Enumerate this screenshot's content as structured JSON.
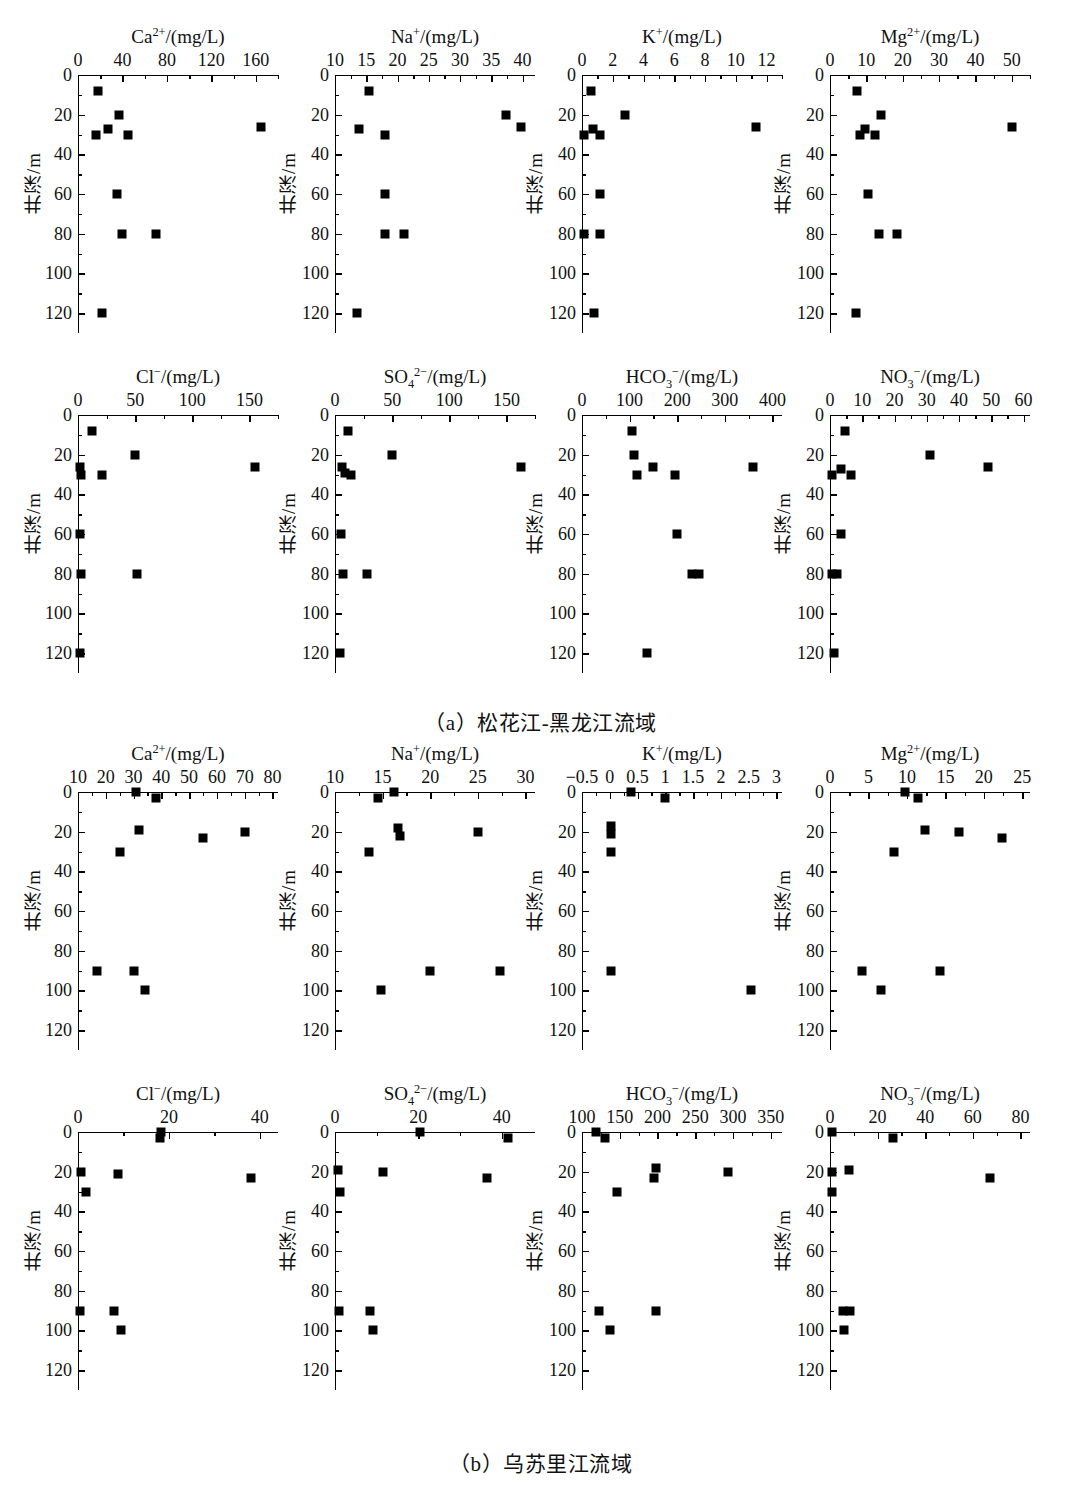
{
  "figure": {
    "ylabel": "井深/m",
    "unit_suffix": "/(mg/L)"
  },
  "captions": {
    "a": "（a）松花江-黑龙江流域",
    "b": "（b）乌苏里江流域"
  },
  "chart_data": [
    {
      "id": "a-ca",
      "type": "scatter",
      "panel": "a",
      "title": "Ca2+/(mg/L)",
      "title_html": "Ca<sup>2+</sup>/(mg/L)",
      "xlabel": "Ca2+/(mg/L)",
      "ylabel": "井深/m",
      "xlim": [
        0,
        180
      ],
      "ylim": [
        0,
        130
      ],
      "xticks": [
        0,
        40,
        80,
        120,
        160
      ],
      "xminor": [
        20,
        60,
        100,
        140,
        180
      ],
      "yticks": [
        0,
        20,
        40,
        60,
        80,
        100,
        120
      ],
      "points": [
        {
          "x": 18,
          "y": 8
        },
        {
          "x": 37,
          "y": 20
        },
        {
          "x": 27,
          "y": 27
        },
        {
          "x": 16,
          "y": 30
        },
        {
          "x": 45,
          "y": 30
        },
        {
          "x": 165,
          "y": 26
        },
        {
          "x": 35,
          "y": 60
        },
        {
          "x": 40,
          "y": 80
        },
        {
          "x": 70,
          "y": 80
        },
        {
          "x": 22,
          "y": 120
        }
      ]
    },
    {
      "id": "a-na",
      "type": "scatter",
      "panel": "a",
      "title": "Na+/(mg/L)",
      "title_html": "Na<sup>+</sup>/(mg/L)",
      "xlabel": "Na+/(mg/L)",
      "ylabel": "井深/m",
      "xlim": [
        10,
        42
      ],
      "ylim": [
        0,
        130
      ],
      "xticks": [
        10,
        15,
        20,
        25,
        30,
        35,
        40
      ],
      "xminor": [
        12.5,
        17.5,
        22.5,
        27.5,
        32.5,
        37.5
      ],
      "yticks": [
        0,
        20,
        40,
        60,
        80,
        100,
        120
      ],
      "points": [
        {
          "x": 15.4,
          "y": 8
        },
        {
          "x": 37.3,
          "y": 20
        },
        {
          "x": 13.8,
          "y": 27
        },
        {
          "x": 39.8,
          "y": 26
        },
        {
          "x": 18.0,
          "y": 30
        },
        {
          "x": 18.0,
          "y": 60
        },
        {
          "x": 18.0,
          "y": 80
        },
        {
          "x": 21.0,
          "y": 80
        },
        {
          "x": 13.5,
          "y": 120
        }
      ]
    },
    {
      "id": "a-k",
      "type": "scatter",
      "panel": "a",
      "title": "K+/(mg/L)",
      "title_html": "K<sup>+</sup>/(mg/L)",
      "xlabel": "K+/(mg/L)",
      "ylabel": "井深/m",
      "xlim": [
        0,
        13
      ],
      "ylim": [
        0,
        130
      ],
      "xticks": [
        0,
        2,
        4,
        6,
        8,
        10,
        12
      ],
      "xminor": [
        1,
        3,
        5,
        7,
        9,
        11,
        13
      ],
      "yticks": [
        0,
        20,
        40,
        60,
        80,
        100,
        120
      ],
      "points": [
        {
          "x": 0.6,
          "y": 8
        },
        {
          "x": 2.8,
          "y": 20
        },
        {
          "x": 0.7,
          "y": 27
        },
        {
          "x": 0.15,
          "y": 30
        },
        {
          "x": 1.2,
          "y": 30
        },
        {
          "x": 11.3,
          "y": 26
        },
        {
          "x": 1.2,
          "y": 60
        },
        {
          "x": 0.15,
          "y": 80
        },
        {
          "x": 1.2,
          "y": 80
        },
        {
          "x": 0.75,
          "y": 120
        }
      ]
    },
    {
      "id": "a-mg",
      "type": "scatter",
      "panel": "a",
      "title": "Mg2+/(mg/L)",
      "title_html": "Mg<sup>2+</sup>/(mg/L)",
      "xlabel": "Mg2+/(mg/L)",
      "ylabel": "井深/m",
      "xlim": [
        0,
        55
      ],
      "ylim": [
        0,
        130
      ],
      "xticks": [
        0,
        10,
        20,
        30,
        40,
        50
      ],
      "xminor": [
        5,
        15,
        25,
        35,
        45,
        55
      ],
      "yticks": [
        0,
        20,
        40,
        60,
        80,
        100,
        120
      ],
      "points": [
        {
          "x": 7.5,
          "y": 8
        },
        {
          "x": 14.0,
          "y": 20
        },
        {
          "x": 9.5,
          "y": 27
        },
        {
          "x": 8.2,
          "y": 30
        },
        {
          "x": 12.4,
          "y": 30
        },
        {
          "x": 50.0,
          "y": 26
        },
        {
          "x": 10.5,
          "y": 60
        },
        {
          "x": 13.5,
          "y": 80
        },
        {
          "x": 18.5,
          "y": 80
        },
        {
          "x": 7.2,
          "y": 120
        }
      ]
    },
    {
      "id": "a-cl",
      "type": "scatter",
      "panel": "a",
      "title": "Cl-/(mg/L)",
      "title_html": "Cl<sup>&#8722;</sup>/(mg/L)",
      "xlabel": "Cl-/(mg/L)",
      "ylabel": "井深/m",
      "xlim": [
        0,
        175
      ],
      "ylim": [
        0,
        130
      ],
      "xticks": [
        0,
        50,
        100,
        150
      ],
      "xminor": [
        25,
        75,
        125,
        175
      ],
      "yticks": [
        0,
        20,
        40,
        60,
        80,
        100,
        120
      ],
      "points": [
        {
          "x": 12,
          "y": 8
        },
        {
          "x": 50,
          "y": 20
        },
        {
          "x": 2,
          "y": 26
        },
        {
          "x": 3,
          "y": 30
        },
        {
          "x": 21,
          "y": 30
        },
        {
          "x": 155,
          "y": 26
        },
        {
          "x": 1.5,
          "y": 60
        },
        {
          "x": 2.5,
          "y": 80
        },
        {
          "x": 52,
          "y": 80
        },
        {
          "x": 1.5,
          "y": 120
        }
      ]
    },
    {
      "id": "a-so4",
      "type": "scatter",
      "panel": "a",
      "title": "SO42-/(mg/L)",
      "title_html": "SO<sub>4</sub><sup>2&#8722;</sup>/(mg/L)",
      "xlabel": "SO42-/(mg/L)",
      "ylabel": "井深/m",
      "xlim": [
        0,
        175
      ],
      "ylim": [
        0,
        130
      ],
      "xticks": [
        0,
        50,
        100,
        150
      ],
      "xminor": [
        25,
        75,
        125,
        175
      ],
      "yticks": [
        0,
        20,
        40,
        60,
        80,
        100,
        120
      ],
      "points": [
        {
          "x": 11,
          "y": 8
        },
        {
          "x": 50,
          "y": 20
        },
        {
          "x": 6,
          "y": 26
        },
        {
          "x": 9,
          "y": 29
        },
        {
          "x": 14,
          "y": 30
        },
        {
          "x": 163,
          "y": 26
        },
        {
          "x": 5,
          "y": 60
        },
        {
          "x": 7,
          "y": 80
        },
        {
          "x": 28,
          "y": 80
        },
        {
          "x": 4,
          "y": 120
        }
      ]
    },
    {
      "id": "a-hco3",
      "type": "scatter",
      "panel": "a",
      "title": "HCO3-/(mg/L)",
      "title_html": "HCO<sub>3</sub><sup>&#8722;</sup>/(mg/L)",
      "xlabel": "HCO3-/(mg/L)",
      "ylabel": "井深/m",
      "xlim": [
        0,
        420
      ],
      "ylim": [
        0,
        130
      ],
      "xticks": [
        0,
        100,
        200,
        300,
        400
      ],
      "xminor": [
        50,
        150,
        250,
        350
      ],
      "yticks": [
        0,
        20,
        40,
        60,
        80,
        100,
        120
      ],
      "points": [
        {
          "x": 105,
          "y": 8
        },
        {
          "x": 110,
          "y": 20
        },
        {
          "x": 150,
          "y": 26
        },
        {
          "x": 115,
          "y": 30
        },
        {
          "x": 196,
          "y": 30
        },
        {
          "x": 360,
          "y": 26
        },
        {
          "x": 200,
          "y": 60
        },
        {
          "x": 232,
          "y": 80
        },
        {
          "x": 245,
          "y": 80
        },
        {
          "x": 137,
          "y": 120
        }
      ]
    },
    {
      "id": "a-no3",
      "type": "scatter",
      "panel": "a",
      "title": "NO3-/(mg/L)",
      "title_html": "NO<sub>3</sub><sup>&#8722;</sup>/(mg/L)",
      "xlabel": "NO3-/(mg/L)",
      "ylabel": "井深/m",
      "xlim": [
        0,
        62
      ],
      "ylim": [
        0,
        130
      ],
      "xticks": [
        0,
        10,
        20,
        30,
        40,
        50,
        60
      ],
      "xminor": [
        5,
        15,
        25,
        35,
        45,
        55
      ],
      "yticks": [
        0,
        20,
        40,
        60,
        80,
        100,
        120
      ],
      "points": [
        {
          "x": 4.5,
          "y": 8
        },
        {
          "x": 31,
          "y": 20
        },
        {
          "x": 3.5,
          "y": 27
        },
        {
          "x": 0.5,
          "y": 30
        },
        {
          "x": 6.5,
          "y": 30
        },
        {
          "x": 49,
          "y": 26
        },
        {
          "x": 3.5,
          "y": 60
        },
        {
          "x": 0.5,
          "y": 80
        },
        {
          "x": 2.2,
          "y": 80
        },
        {
          "x": 1.2,
          "y": 120
        }
      ]
    },
    {
      "id": "b-ca",
      "type": "scatter",
      "panel": "b",
      "title": "Ca2+/(mg/L)",
      "title_html": "Ca<sup>2+</sup>/(mg/L)",
      "xlabel": "Ca2+/(mg/L)",
      "ylabel": "井深/m",
      "xlim": [
        10,
        82
      ],
      "ylim": [
        0,
        130
      ],
      "xticks": [
        10,
        20,
        30,
        40,
        50,
        60,
        70,
        80
      ],
      "xminor": [
        15,
        25,
        35,
        45,
        55,
        65,
        75
      ],
      "yticks": [
        0,
        20,
        40,
        60,
        80,
        100,
        120
      ],
      "points": [
        {
          "x": 31,
          "y": 0
        },
        {
          "x": 38,
          "y": 3
        },
        {
          "x": 32,
          "y": 19
        },
        {
          "x": 55,
          "y": 23
        },
        {
          "x": 70,
          "y": 20
        },
        {
          "x": 25,
          "y": 30
        },
        {
          "x": 17,
          "y": 90
        },
        {
          "x": 30,
          "y": 90
        },
        {
          "x": 34,
          "y": 100
        }
      ]
    },
    {
      "id": "b-na",
      "type": "scatter",
      "panel": "b",
      "title": "Na+/(mg/L)",
      "title_html": "Na<sup>+</sup>/(mg/L)",
      "xlabel": "Na+/(mg/L)",
      "ylabel": "井深/m",
      "xlim": [
        10,
        31
      ],
      "ylim": [
        0,
        130
      ],
      "xticks": [
        10,
        15,
        20,
        25,
        30
      ],
      "xminor": [
        12.5,
        17.5,
        22.5,
        27.5
      ],
      "yticks": [
        0,
        20,
        40,
        60,
        80,
        100,
        120
      ],
      "points": [
        {
          "x": 16.2,
          "y": 0
        },
        {
          "x": 14.5,
          "y": 3
        },
        {
          "x": 16.6,
          "y": 18
        },
        {
          "x": 16.8,
          "y": 22
        },
        {
          "x": 25.0,
          "y": 20
        },
        {
          "x": 13.6,
          "y": 30
        },
        {
          "x": 20.0,
          "y": 90
        },
        {
          "x": 27.3,
          "y": 90
        },
        {
          "x": 14.8,
          "y": 100
        }
      ]
    },
    {
      "id": "b-k",
      "type": "scatter",
      "panel": "b",
      "title": "K+/(mg/L)",
      "title_html": "K<sup>+</sup>/(mg/L)",
      "xlabel": "K+/(mg/L)",
      "ylabel": "井深/m",
      "xlim": [
        -0.5,
        3.1
      ],
      "ylim": [
        0,
        130
      ],
      "xticks": [
        -0.5,
        0,
        0.5,
        1.0,
        1.5,
        2.0,
        2.5,
        3.0
      ],
      "xminor": [
        -0.25,
        0.25,
        0.75,
        1.25,
        1.75,
        2.25,
        2.75
      ],
      "yticks": [
        0,
        20,
        40,
        60,
        80,
        100,
        120
      ],
      "points": [
        {
          "x": 0.38,
          "y": 0
        },
        {
          "x": 1.0,
          "y": 3
        },
        {
          "x": 0.02,
          "y": 17
        },
        {
          "x": 0.02,
          "y": 21
        },
        {
          "x": 0.02,
          "y": 30
        },
        {
          "x": 0.02,
          "y": 90
        },
        {
          "x": 2.55,
          "y": 100
        }
      ]
    },
    {
      "id": "b-mg",
      "type": "scatter",
      "panel": "b",
      "title": "Mg2+/(mg/L)",
      "title_html": "Mg<sup>2+</sup>/(mg/L)",
      "xlabel": "Mg2+/(mg/L)",
      "ylabel": "井深/m",
      "xlim": [
        0,
        26
      ],
      "ylim": [
        0,
        130
      ],
      "xticks": [
        0,
        5,
        10,
        15,
        20,
        25
      ],
      "xminor": [
        2.5,
        7.5,
        12.5,
        17.5,
        22.5
      ],
      "yticks": [
        0,
        20,
        40,
        60,
        80,
        100,
        120
      ],
      "points": [
        {
          "x": 9.7,
          "y": 0
        },
        {
          "x": 11.5,
          "y": 3
        },
        {
          "x": 12.3,
          "y": 19
        },
        {
          "x": 16.8,
          "y": 20
        },
        {
          "x": 22.4,
          "y": 23
        },
        {
          "x": 8.3,
          "y": 30
        },
        {
          "x": 4.2,
          "y": 90
        },
        {
          "x": 14.3,
          "y": 90
        },
        {
          "x": 6.6,
          "y": 100
        }
      ]
    },
    {
      "id": "b-cl",
      "type": "scatter",
      "panel": "b",
      "title": "Cl-/(mg/L)",
      "title_html": "Cl<sup>&#8722;</sup>/(mg/L)",
      "xlabel": "Cl-/(mg/L)",
      "ylabel": "井深/m",
      "xlim": [
        0,
        44
      ],
      "ylim": [
        0,
        130
      ],
      "xticks": [
        0,
        20,
        40
      ],
      "xminor": [
        10,
        30
      ],
      "yticks": [
        0,
        20,
        40,
        60,
        80,
        100,
        120
      ],
      "points": [
        {
          "x": 18.3,
          "y": 0
        },
        {
          "x": 18.0,
          "y": 3
        },
        {
          "x": 0.6,
          "y": 20
        },
        {
          "x": 8.8,
          "y": 21
        },
        {
          "x": 38.0,
          "y": 23
        },
        {
          "x": 1.8,
          "y": 30
        },
        {
          "x": 0.5,
          "y": 90
        },
        {
          "x": 8.0,
          "y": 90
        },
        {
          "x": 9.5,
          "y": 100
        }
      ]
    },
    {
      "id": "b-so4",
      "type": "scatter",
      "panel": "b",
      "title": "SO42-/(mg/L)",
      "title_html": "SO<sub>4</sub><sup>2&#8722;</sup>/(mg/L)",
      "xlabel": "SO42-/(mg/L)",
      "ylabel": "井深/m",
      "xlim": [
        0,
        48
      ],
      "ylim": [
        0,
        130
      ],
      "xticks": [
        0,
        20,
        40
      ],
      "xminor": [
        10,
        30
      ],
      "yticks": [
        0,
        20,
        40,
        60,
        80,
        100,
        120
      ],
      "points": [
        {
          "x": 20.5,
          "y": 0
        },
        {
          "x": 41.5,
          "y": 3
        },
        {
          "x": 0.8,
          "y": 19
        },
        {
          "x": 11.5,
          "y": 20
        },
        {
          "x": 36.5,
          "y": 23
        },
        {
          "x": 1.2,
          "y": 30
        },
        {
          "x": 1.0,
          "y": 90
        },
        {
          "x": 8.5,
          "y": 90
        },
        {
          "x": 9.0,
          "y": 100
        }
      ]
    },
    {
      "id": "b-hco3",
      "type": "scatter",
      "panel": "b",
      "title": "HCO3-/(mg/L)",
      "title_html": "HCO<sub>3</sub><sup>&#8722;</sup>/(mg/L)",
      "xlabel": "HCO3-/(mg/L)",
      "ylabel": "井深/m",
      "xlim": [
        100,
        365
      ],
      "ylim": [
        0,
        130
      ],
      "xticks": [
        100,
        150,
        200,
        250,
        300,
        350
      ],
      "xminor": [
        125,
        175,
        225,
        275,
        325
      ],
      "yticks": [
        0,
        20,
        40,
        60,
        80,
        100,
        120
      ],
      "points": [
        {
          "x": 118,
          "y": 0
        },
        {
          "x": 130,
          "y": 3
        },
        {
          "x": 198,
          "y": 18
        },
        {
          "x": 196,
          "y": 23
        },
        {
          "x": 293,
          "y": 20
        },
        {
          "x": 147,
          "y": 30
        },
        {
          "x": 123,
          "y": 90
        },
        {
          "x": 198,
          "y": 90
        },
        {
          "x": 137,
          "y": 100
        }
      ]
    },
    {
      "id": "b-no3",
      "type": "scatter",
      "panel": "b",
      "title": "NO3-/(mg/L)",
      "title_html": "NO<sub>3</sub><sup>&#8722;</sup>/(mg/L)",
      "xlabel": "NO3-/(mg/L)",
      "ylabel": "井深/m",
      "xlim": [
        0,
        84
      ],
      "ylim": [
        0,
        130
      ],
      "xticks": [
        0,
        20,
        40,
        60,
        80
      ],
      "xminor": [
        10,
        30,
        50,
        70
      ],
      "yticks": [
        0,
        20,
        40,
        60,
        80,
        100,
        120
      ],
      "points": [
        {
          "x": 0.8,
          "y": 0
        },
        {
          "x": 26.5,
          "y": 3
        },
        {
          "x": 0.8,
          "y": 20
        },
        {
          "x": 8.0,
          "y": 19
        },
        {
          "x": 67.0,
          "y": 23
        },
        {
          "x": 0.8,
          "y": 30
        },
        {
          "x": 5.5,
          "y": 90
        },
        {
          "x": 8.5,
          "y": 90
        },
        {
          "x": 6.0,
          "y": 100
        }
      ]
    }
  ],
  "layout": {
    "panel_a": {
      "row1_top": 25,
      "row2_top": 365,
      "cols_x": [
        78,
        335,
        582,
        830
      ]
    },
    "panel_b": {
      "row1_top": 742,
      "row2_top": 1082,
      "cols_x": [
        78,
        335,
        582,
        830
      ]
    },
    "plot_w": 200,
    "plot_h": 258,
    "caption_a_top": 706,
    "caption_b_top": 1447
  }
}
